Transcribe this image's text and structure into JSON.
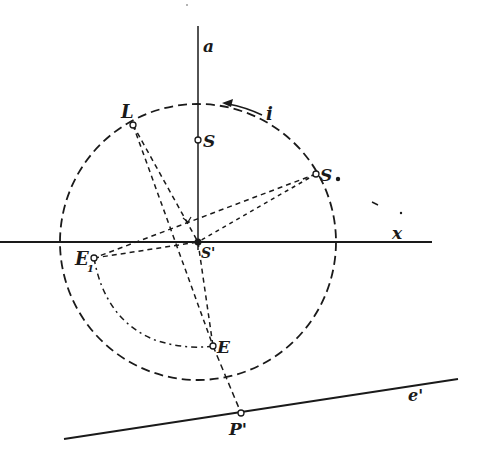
{
  "figure": {
    "type": "descriptive-geometry construction",
    "labels": {
      "axis_a": "a",
      "axis_x": "x",
      "circle_i": "i",
      "point_L": "L",
      "point_S": "S",
      "point_S_dot": "S.",
      "point_S_prime": "S'",
      "point_E": "E",
      "point_E1": "E",
      "point_E1_sub": "1",
      "point_P_prime": "P'",
      "line_e_prime": "e'"
    },
    "colors": {
      "ink": "#1a1a1a",
      "paper": "#ffffff"
    }
  }
}
